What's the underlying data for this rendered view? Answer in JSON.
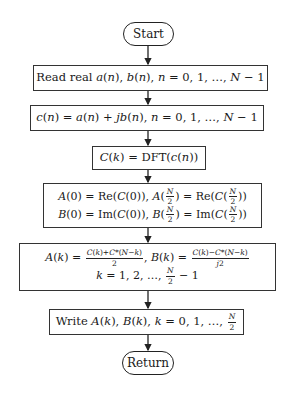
{
  "flowchart": {
    "start": "Start",
    "end": "Return",
    "steps": [
      {
        "id": "read",
        "text": "Read real a(n), b(n), n = 0, 1, …, N − 1"
      },
      {
        "id": "combine",
        "text": "c(n) = a(n) + jb(n), n = 0, 1, …, N − 1"
      },
      {
        "id": "dft",
        "text": "C(k) = DFT(c(n))"
      },
      {
        "id": "edges",
        "lines": [
          "A(0) = Re(C(0)), A(N/2) = Re(C(N/2))",
          "B(0) = Im(C(0)), B(N/2) = Im(C(N/2))"
        ]
      },
      {
        "id": "split",
        "lines": [
          "A(k) = (C(k)+C*(N−k))/2, B(k) = (C(k)−C*(N−k))/j2",
          "k = 1, 2, …, N/2 − 1"
        ]
      },
      {
        "id": "write",
        "text": "Write A(k), B(k), k = 0, 1, …, N/2"
      }
    ],
    "render": {
      "read_prefix": "Read real ",
      "write_prefix": "Write ",
      "dft_op": "DFT",
      "re": "Re",
      "im": "Im"
    }
  }
}
